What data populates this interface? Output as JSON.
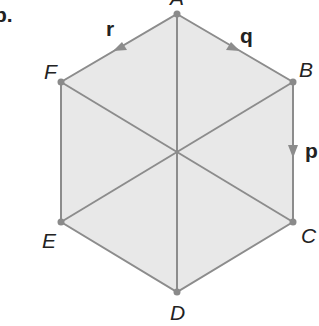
{
  "part_label": "b.",
  "colors": {
    "fill": "#e8e8e8",
    "line": "#8c8c8c",
    "point": "#8a8a8a",
    "text": "#222222"
  },
  "vertices": {
    "A": {
      "label": "A",
      "x": 177,
      "y": 14
    },
    "B": {
      "label": "B",
      "x": 293,
      "y": 82
    },
    "C": {
      "label": "C",
      "x": 293,
      "y": 222
    },
    "D": {
      "label": "D",
      "x": 177,
      "y": 292
    },
    "E": {
      "label": "E",
      "x": 61,
      "y": 222
    },
    "F": {
      "label": "F",
      "x": 61,
      "y": 82
    }
  },
  "center": {
    "x": 177,
    "y": 152
  },
  "vectors": {
    "p": {
      "label": "p",
      "from": "B",
      "to": "C"
    },
    "q": {
      "label": "q",
      "from": "A",
      "to": "B"
    },
    "r": {
      "label": "r",
      "from": "A",
      "to": "F"
    }
  },
  "diagonals": [
    "A-D",
    "B-E",
    "C-F"
  ]
}
